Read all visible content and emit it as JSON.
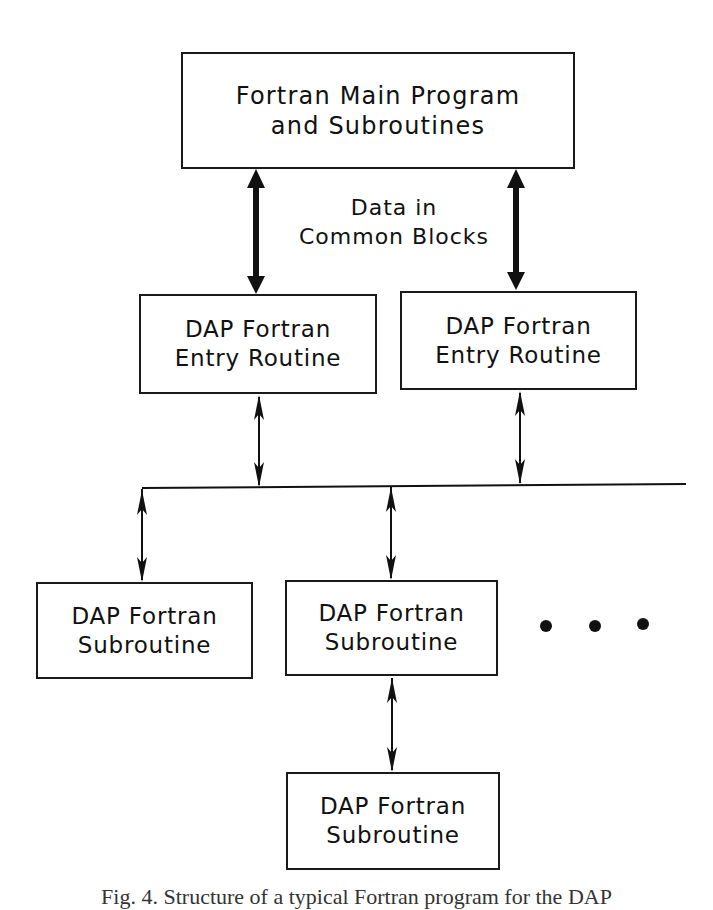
{
  "diagram": {
    "type": "software-structure-flow",
    "nodes": {
      "main_program": {
        "lines": [
          "Fortran Main Program",
          "and Subroutines"
        ]
      },
      "entry_left": {
        "lines": [
          "DAP Fortran",
          "Entry Routine"
        ]
      },
      "entry_right": {
        "lines": [
          "DAP Fortran",
          "Entry Routine"
        ]
      },
      "sub_left": {
        "lines": [
          "DAP Fortran",
          "Subroutine"
        ]
      },
      "sub_middle": {
        "lines": [
          "DAP Fortran",
          "Subroutine"
        ]
      },
      "sub_bottom": {
        "lines": [
          "DAP Fortran",
          "Subroutine"
        ]
      }
    },
    "shared_data_label": {
      "lines": [
        "Data in",
        "Common Blocks"
      ]
    },
    "continuation": "• • •",
    "edges": [
      {
        "from": "main_program",
        "to": "entry_left",
        "style": "thick-bidirectional"
      },
      {
        "from": "main_program",
        "to": "entry_right",
        "style": "thick-bidirectional"
      },
      {
        "from": "entry_left",
        "to": "bus",
        "style": "thin-bidirectional"
      },
      {
        "from": "entry_right",
        "to": "bus",
        "style": "thin-bidirectional"
      },
      {
        "from": "bus",
        "to": "sub_left",
        "style": "thin-bidirectional"
      },
      {
        "from": "bus",
        "to": "sub_middle",
        "style": "thin-bidirectional"
      },
      {
        "from": "sub_middle",
        "to": "sub_bottom",
        "style": "thin-bidirectional"
      }
    ],
    "caption": "Fig. 4. Structure of a typical Fortran program for the DAP"
  },
  "colors": {
    "ink": "#111111",
    "background": "#ffffff"
  }
}
